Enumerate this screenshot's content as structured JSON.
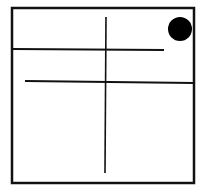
{
  "diagram": {
    "stroke_color": "#111111",
    "background": "#ffffff",
    "frame": {
      "x": 12,
      "y": 8,
      "width": 182,
      "height": 175
    },
    "lines": [
      {
        "id": "vertical-divider",
        "x1": 106,
        "y1": 17,
        "x2": 105,
        "y2": 173
      },
      {
        "id": "upper-horizontal",
        "x1": 13,
        "y1": 49,
        "x2": 164,
        "y2": 50
      },
      {
        "id": "lower-horizontal",
        "x1": 25,
        "y1": 81,
        "x2": 194,
        "y2": 83
      }
    ],
    "dot": {
      "cx": 180,
      "cy": 29,
      "r": 12,
      "fill": "#000000"
    }
  }
}
